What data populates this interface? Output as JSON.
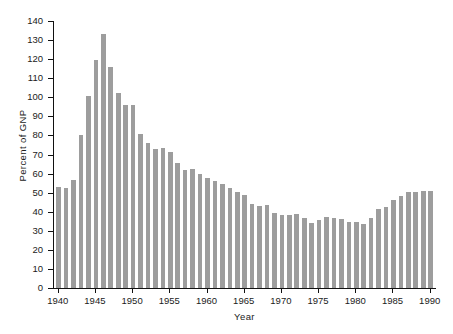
{
  "chart_data": {
    "type": "bar",
    "title": "",
    "xlabel": "Year",
    "ylabel": "Percent of GNP",
    "ylim": [
      0,
      140
    ],
    "ytick_step": 10,
    "yticks": [
      0,
      10,
      20,
      30,
      40,
      50,
      60,
      70,
      80,
      90,
      100,
      110,
      120,
      130,
      140
    ],
    "xlim": [
      1940,
      1990
    ],
    "xticks": [
      1940,
      1945,
      1950,
      1955,
      1960,
      1965,
      1970,
      1975,
      1980,
      1985,
      1990
    ],
    "grid": false,
    "legend": false,
    "bar_color": "#9d9d9d",
    "axis_color": "#111111",
    "categories": [
      1940,
      1941,
      1942,
      1943,
      1944,
      1945,
      1946,
      1947,
      1948,
      1949,
      1950,
      1951,
      1952,
      1953,
      1954,
      1955,
      1956,
      1957,
      1958,
      1959,
      1960,
      1961,
      1962,
      1963,
      1964,
      1965,
      1966,
      1967,
      1968,
      1969,
      1970,
      1971,
      1972,
      1973,
      1974,
      1975,
      1976,
      1977,
      1978,
      1979,
      1980,
      1981,
      1982,
      1983,
      1984,
      1985,
      1986,
      1987,
      1988,
      1989,
      1990
    ],
    "values": [
      53.2,
      52.4,
      56.6,
      80.0,
      100.5,
      119.6,
      133.3,
      115.7,
      102.1,
      95.9,
      96.0,
      80.9,
      76.0,
      72.9,
      73.6,
      71.3,
      65.5,
      61.8,
      62.4,
      59.8,
      57.7,
      56.2,
      54.4,
      52.6,
      50.6,
      48.6,
      44.3,
      42.8,
      43.6,
      39.4,
      38.2,
      38.4,
      38.7,
      36.7,
      34.2,
      35.6,
      37.1,
      36.5,
      36.2,
      34.5,
      34.4,
      33.8,
      36.6,
      41.5,
      42.7,
      46.2,
      48.0,
      50.3,
      50.6,
      50.8,
      50.9
    ]
  },
  "axis": {
    "ylabel_text": "Percent of GNP",
    "xlabel_text": "Year",
    "ytick_labels": [
      "140",
      "130",
      "120",
      "110",
      "100",
      "90",
      "80",
      "70",
      "60",
      "50",
      "40",
      "30",
      "20",
      "10",
      "0"
    ],
    "xtick_labels": [
      "1940",
      "1945",
      "1950",
      "1955",
      "1960",
      "1965",
      "1970",
      "1975",
      "1980",
      "1985",
      "1990"
    ]
  }
}
